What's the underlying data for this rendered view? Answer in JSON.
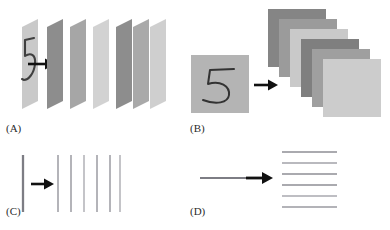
{
  "figure": {
    "width": 390,
    "height": 230,
    "background": "#ffffff"
  },
  "panels": [
    {
      "id": "A",
      "label": "(A)",
      "caption_label": "(A)",
      "description": "handwritten digit on a slanted plane transformed into a stack of slanted feature planes",
      "input": {
        "kind": "slanted-plane-with-digit",
        "digit": "5",
        "plane_fill": "#c9c9c9",
        "stroke_color": "#3a3a3a"
      },
      "arrow": {
        "color": "#111111"
      },
      "output": {
        "kind": "slanted-plane-stack",
        "count": 6,
        "fills": [
          "#8d8d8d",
          "#a6a6a6",
          "#d2d2d2",
          "#8d8d8d",
          "#a9a9a9",
          "#cfcfcf"
        ]
      }
    },
    {
      "id": "B",
      "label": "(B)",
      "caption_label": "(B)",
      "description": "handwritten digit on a square image transformed into a cascading stack of square feature maps",
      "input": {
        "kind": "square-image-with-digit",
        "digit": "5",
        "plane_fill": "#b4b4b4",
        "stroke_color": "#333333"
      },
      "arrow": {
        "color": "#111111"
      },
      "output": {
        "kind": "square-map-stack",
        "count": 6,
        "fills": [
          "#858585",
          "#9b9b9b",
          "#c9c9c9",
          "#7f7f7f",
          "#9f9f9f",
          "#cccccc"
        ]
      }
    },
    {
      "id": "C",
      "label": "(C)",
      "caption_label": "(C)",
      "description": "a single vertical line transformed into six vertical lines",
      "input": {
        "kind": "vertical-line",
        "count": 1,
        "color": "#7d7d84"
      },
      "arrow": {
        "color": "#111111"
      },
      "output": {
        "kind": "vertical-line-group",
        "count": 6,
        "color": "#9b9ba2"
      }
    },
    {
      "id": "D",
      "label": "(D)",
      "caption_label": "(D)",
      "description": "a single horizontal line transformed into six stacked horizontal lines",
      "input": {
        "kind": "horizontal-line",
        "count": 1,
        "color": "#7d7d84"
      },
      "arrow": {
        "color": "#111111"
      },
      "output": {
        "kind": "horizontal-line-group",
        "count": 6,
        "color": "#9b9ba2"
      }
    }
  ]
}
